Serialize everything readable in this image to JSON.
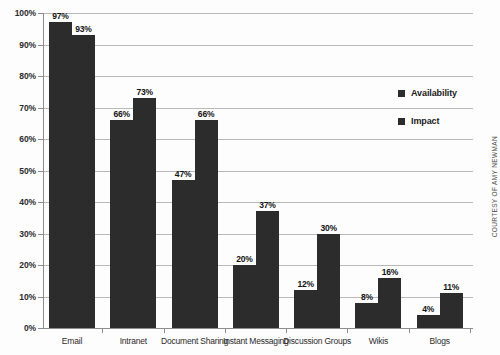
{
  "chart_data": {
    "type": "bar",
    "title": "",
    "xlabel": "",
    "ylabel": "",
    "ylim": [
      0,
      100
    ],
    "grid": true,
    "legend_position": "right",
    "categories": [
      "Email",
      "Intranet",
      "Document Sharing",
      "Instant Messaging",
      "Discussion Groups",
      "Wikis",
      "Blogs"
    ],
    "y_ticks": [
      "0%",
      "10%",
      "20%",
      "30%",
      "40%",
      "50%",
      "60%",
      "70%",
      "80%",
      "90%",
      "100%"
    ],
    "series": [
      {
        "name": "Availability",
        "color": "#2c2c2c",
        "values": [
          97,
          66,
          47,
          20,
          12,
          8,
          4
        ],
        "labels": [
          "97%",
          "66%",
          "47%",
          "20%",
          "12%",
          "8%",
          "4%"
        ]
      },
      {
        "name": "Impact",
        "color": "#2c2c2c",
        "values": [
          93,
          73,
          66,
          37,
          30,
          16,
          11
        ],
        "labels": [
          "93%",
          "73%",
          "66%",
          "37%",
          "30%",
          "16%",
          "11%"
        ]
      }
    ]
  },
  "credit": {
    "text": "COURTESY OF AMY NEWMAN"
  },
  "colors": {
    "bar": "#2c2c2c",
    "gridline": "#b9b9b9",
    "axis": "#8d8d8d",
    "background": "#fdfdfd",
    "text": "#2b2b2b"
  }
}
